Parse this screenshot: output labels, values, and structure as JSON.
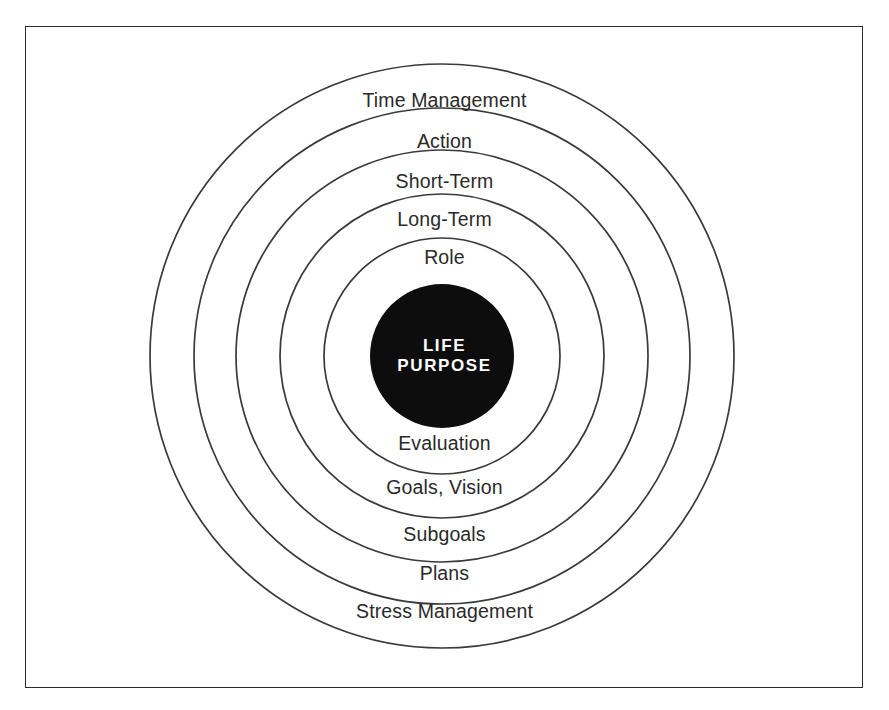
{
  "figure": {
    "type": "concentric-circles-diagram",
    "background_color": "#ffffff",
    "frame_color": "#2b2b2b",
    "ring_stroke_color": "#3a3a3a",
    "core_fill_color": "#0d0d0d",
    "core_text_color": "#ffffff",
    "center": {
      "x": 442,
      "y": 356
    },
    "core": {
      "radius": 72,
      "line1": "LIFE",
      "line2": "PURPOSE"
    },
    "rings": [
      {
        "radius": 292,
        "top_label": "Time Management",
        "bottom_label": "Stress Management",
        "top_label_y": 101,
        "bottom_label_y": 612
      },
      {
        "radius": 248,
        "top_label": "Action",
        "bottom_label": "Plans",
        "top_label_y": 142,
        "bottom_label_y": 574
      },
      {
        "radius": 206,
        "top_label": "Short-Term",
        "bottom_label": "Subgoals",
        "top_label_y": 182,
        "bottom_label_y": 535
      },
      {
        "radius": 162,
        "top_label": "Long-Term",
        "bottom_label": "Goals, Vision",
        "top_label_y": 220,
        "bottom_label_y": 488
      },
      {
        "radius": 118,
        "top_label": "Role",
        "bottom_label": "Evaluation",
        "top_label_y": 258,
        "bottom_label_y": 444
      }
    ]
  },
  "labels": {
    "outer_top": "Time Management",
    "ring2_top": "Action",
    "ring3_top": "Short-Term",
    "ring4_top": "Long-Term",
    "ring5_top": "Role",
    "core_line1": "LIFE",
    "core_line2": "PURPOSE",
    "ring5_bottom": "Evaluation",
    "ring4_bottom": "Goals, Vision",
    "ring3_bottom": "Subgoals",
    "ring2_bottom": "Plans",
    "outer_bottom": "Stress Management"
  }
}
